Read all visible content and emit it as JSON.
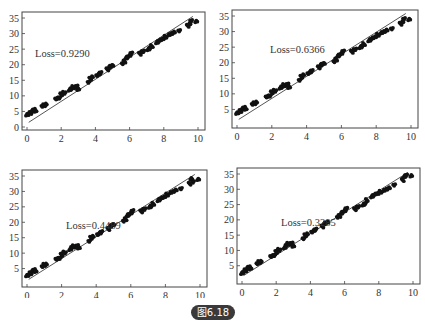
{
  "caption": "图6.18",
  "colors": {
    "points": "#111111",
    "fit_line": "#555555",
    "frame": "#444444",
    "caption_bg": "#3a3a3a"
  },
  "chart_data": [
    {
      "type": "scatter",
      "title": "",
      "annotation": "Loss=0.9290",
      "xlabel": "",
      "ylabel": "",
      "xlim": [
        0,
        10
      ],
      "ylim": [
        0,
        35
      ],
      "xticks": [
        "0",
        "2",
        "4",
        "6",
        "8",
        "10"
      ],
      "yticks": [
        "0",
        "5",
        "10",
        "15",
        "20",
        "25",
        "30",
        "35"
      ],
      "fit_line": {
        "x": [
          0.1,
          9.7
        ],
        "y": [
          1.5,
          35.5
        ]
      },
      "grid": false,
      "points": {
        "x": [
          0.0,
          0.1,
          0.2,
          0.3,
          0.4,
          0.5,
          0.9,
          1.0,
          1.1,
          1.7,
          1.8,
          1.9,
          2.0,
          2.1,
          2.2,
          2.5,
          2.6,
          2.7,
          2.8,
          2.9,
          3.0,
          3.6,
          3.7,
          3.8,
          4.1,
          4.2,
          4.3,
          4.7,
          4.8,
          4.9,
          5.0,
          5.6,
          5.7,
          5.8,
          5.9,
          6.0,
          6.1,
          6.6,
          6.7,
          6.8,
          7.1,
          7.2,
          7.3,
          7.6,
          7.7,
          7.8,
          8.0,
          8.1,
          8.3,
          8.5,
          8.6,
          8.9,
          9.4,
          9.5,
          9.6,
          9.9
        ],
        "y": [
          4.0,
          4.2,
          4.5,
          5.0,
          5.5,
          5.2,
          6.8,
          7.0,
          7.2,
          9.0,
          9.3,
          9.5,
          10.5,
          11.0,
          10.8,
          12.0,
          12.5,
          12.8,
          12.6,
          13.0,
          12.2,
          14.5,
          15.5,
          16.0,
          16.5,
          17.0,
          17.5,
          18.5,
          19.0,
          19.5,
          19.8,
          20.5,
          21.0,
          22.0,
          22.5,
          23.0,
          23.8,
          23.5,
          24.0,
          24.2,
          25.0,
          25.5,
          26.0,
          27.0,
          27.5,
          28.0,
          28.5,
          29.0,
          29.5,
          30.0,
          30.5,
          31.0,
          32.5,
          33.0,
          34.0,
          34.0
        ]
      }
    },
    {
      "type": "scatter",
      "title": "",
      "annotation": "Loss=0.6366",
      "xlabel": "",
      "ylabel": "",
      "xlim": [
        0,
        10
      ],
      "ylim": [
        0,
        35
      ],
      "xticks": [
        "0",
        "2",
        "4",
        "6",
        "8",
        "10"
      ],
      "yticks": [
        "5",
        "10",
        "15",
        "20",
        "25",
        "30",
        "35"
      ],
      "fit_line": {
        "x": [
          0.1,
          9.7
        ],
        "y": [
          1.8,
          35.8
        ]
      },
      "grid": false,
      "points": {
        "x": [
          0.0,
          0.1,
          0.2,
          0.3,
          0.4,
          0.5,
          0.9,
          1.0,
          1.1,
          1.7,
          1.8,
          1.9,
          2.0,
          2.1,
          2.2,
          2.5,
          2.6,
          2.7,
          2.8,
          2.9,
          3.0,
          3.6,
          3.7,
          3.8,
          4.1,
          4.2,
          4.3,
          4.7,
          4.8,
          4.9,
          5.0,
          5.6,
          5.7,
          5.8,
          5.9,
          6.0,
          6.1,
          6.6,
          6.7,
          6.8,
          7.1,
          7.2,
          7.3,
          7.6,
          7.7,
          7.8,
          8.0,
          8.1,
          8.3,
          8.5,
          8.6,
          8.9,
          9.4,
          9.5,
          9.6,
          9.9
        ],
        "y": [
          3.9,
          4.1,
          4.5,
          5.0,
          5.5,
          5.2,
          6.8,
          7.0,
          7.2,
          9.0,
          9.3,
          9.5,
          10.5,
          11.0,
          10.8,
          12.0,
          12.5,
          12.8,
          12.6,
          13.0,
          12.2,
          14.5,
          15.5,
          16.0,
          16.5,
          17.0,
          17.5,
          18.5,
          19.0,
          19.5,
          19.8,
          20.5,
          21.0,
          22.0,
          22.5,
          23.0,
          23.8,
          23.5,
          24.0,
          24.2,
          25.0,
          25.5,
          26.0,
          27.0,
          27.5,
          28.0,
          28.5,
          29.0,
          29.5,
          30.0,
          30.5,
          31.0,
          32.5,
          33.0,
          34.0,
          34.0
        ]
      }
    },
    {
      "type": "scatter",
      "title": "",
      "annotation": "Loss=0.4489",
      "xlabel": "",
      "ylabel": "",
      "xlim": [
        0,
        10
      ],
      "ylim": [
        0,
        35
      ],
      "xticks": [
        "0",
        "2",
        "4",
        "6",
        "8",
        "10"
      ],
      "yticks": [
        "5",
        "10",
        "15",
        "20",
        "25",
        "30",
        "35"
      ],
      "fit_line": {
        "x": [
          0.1,
          9.7
        ],
        "y": [
          1.5,
          35.5
        ]
      },
      "grid": false,
      "points": {
        "x": [
          0.0,
          0.1,
          0.2,
          0.3,
          0.4,
          0.5,
          0.9,
          1.0,
          1.1,
          1.7,
          1.8,
          1.9,
          2.0,
          2.1,
          2.2,
          2.5,
          2.6,
          2.7,
          2.8,
          2.9,
          3.0,
          3.6,
          3.7,
          3.8,
          4.1,
          4.2,
          4.3,
          4.7,
          4.8,
          4.9,
          5.0,
          5.6,
          5.7,
          5.8,
          5.9,
          6.0,
          6.1,
          6.6,
          6.7,
          6.8,
          7.1,
          7.2,
          7.3,
          7.6,
          7.7,
          7.8,
          8.0,
          8.1,
          8.3,
          8.5,
          8.6,
          8.9,
          9.4,
          9.5,
          9.6,
          9.9
        ],
        "y": [
          2.8,
          3.0,
          3.5,
          4.0,
          4.5,
          4.2,
          5.8,
          6.2,
          6.3,
          8.0,
          8.3,
          8.5,
          9.5,
          10.2,
          10.0,
          11.3,
          12.0,
          12.2,
          12.0,
          12.3,
          11.8,
          14.0,
          15.0,
          15.3,
          16.0,
          16.5,
          17.0,
          17.8,
          18.5,
          19.0,
          19.3,
          20.5,
          21.0,
          22.0,
          22.5,
          23.0,
          23.8,
          23.5,
          24.0,
          24.2,
          25.0,
          25.5,
          26.0,
          27.0,
          27.5,
          28.0,
          28.5,
          29.0,
          29.5,
          30.0,
          30.5,
          31.0,
          32.5,
          34.0,
          33.0,
          34.0
        ]
      }
    },
    {
      "type": "scatter",
      "title": "",
      "annotation": "Loss=0.3285",
      "xlabel": "",
      "ylabel": "",
      "xlim": [
        0,
        10
      ],
      "ylim": [
        0,
        35
      ],
      "xticks": [
        "0",
        "2",
        "4",
        "6",
        "8",
        "10"
      ],
      "yticks": [
        "5",
        "10",
        "15",
        "20",
        "25",
        "30",
        "35"
      ],
      "fit_line": {
        "x": [
          0.1,
          9.7
        ],
        "y": [
          1.8,
          35.5
        ]
      },
      "grid": false,
      "points": {
        "x": [
          0.0,
          0.1,
          0.2,
          0.3,
          0.4,
          0.5,
          0.9,
          1.0,
          1.1,
          1.7,
          1.8,
          1.9,
          2.0,
          2.1,
          2.2,
          2.5,
          2.6,
          2.7,
          2.8,
          2.9,
          3.0,
          3.6,
          3.7,
          3.8,
          4.1,
          4.2,
          4.3,
          4.7,
          4.8,
          4.9,
          5.0,
          5.6,
          5.7,
          5.8,
          5.9,
          6.0,
          6.1,
          6.6,
          6.7,
          6.8,
          7.1,
          7.2,
          7.3,
          7.6,
          7.7,
          7.8,
          8.0,
          8.1,
          8.3,
          8.5,
          8.6,
          8.9,
          9.4,
          9.5,
          9.6,
          9.9
        ],
        "y": [
          2.6,
          3.0,
          3.5,
          4.0,
          4.5,
          4.2,
          5.8,
          6.2,
          6.3,
          8.0,
          8.3,
          8.5,
          9.5,
          10.2,
          10.0,
          11.0,
          11.8,
          12.2,
          12.0,
          12.3,
          11.5,
          14.0,
          15.0,
          15.3,
          16.0,
          16.5,
          17.0,
          17.8,
          18.5,
          19.0,
          19.3,
          21.0,
          21.3,
          22.0,
          22.5,
          23.0,
          23.8,
          23.5,
          24.0,
          24.2,
          25.0,
          25.5,
          26.5,
          27.5,
          28.0,
          28.5,
          28.8,
          29.2,
          29.5,
          30.0,
          30.5,
          31.5,
          33.0,
          34.0,
          34.5,
          34.5
        ]
      }
    }
  ]
}
